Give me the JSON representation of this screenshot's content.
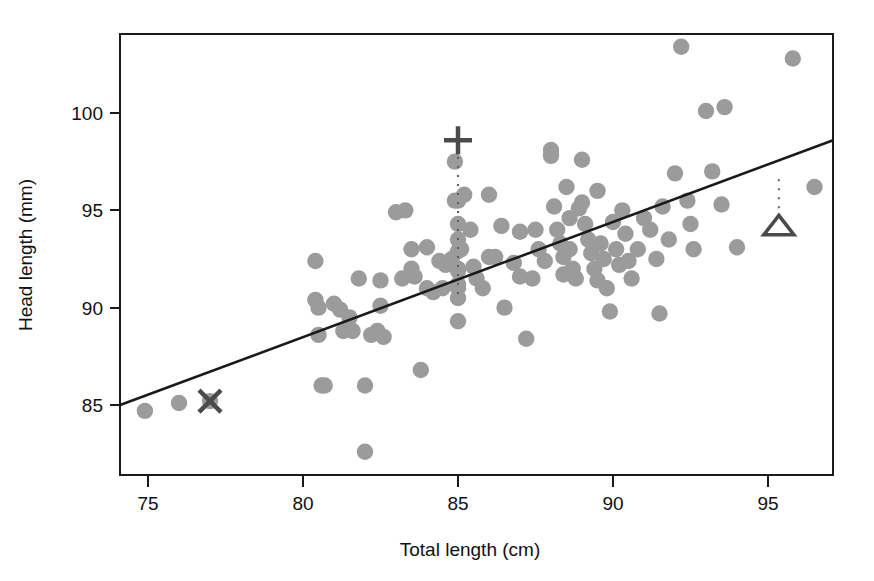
{
  "figure": {
    "background_color": "#ffffff",
    "frame_color": "#1a1a1a",
    "dot_color": "#9b9b9b",
    "marker_color": "#4a4a4a"
  },
  "chart_data": {
    "type": "scatter",
    "title": "",
    "xlabel": "Total length (cm)",
    "ylabel": "Head length (mm)",
    "xlim": [
      74.1,
      97.1
    ],
    "ylim": [
      82.0,
      104.2
    ],
    "xticks": [
      75,
      80,
      85,
      90,
      95
    ],
    "xticklabels": [
      "75",
      "80",
      "85",
      "90",
      "95"
    ],
    "yticks": [
      85,
      90,
      95,
      100
    ],
    "yticklabels": [
      "85",
      "90",
      "95",
      "100"
    ],
    "grid": false,
    "legend": null,
    "series": [
      {
        "name": "observations",
        "marker": "filled-circle",
        "color": "#9b9b9b",
        "x": [
          74.9,
          76.0,
          77.0,
          80.4,
          80.4,
          80.5,
          80.5,
          80.6,
          80.7,
          81.0,
          81.2,
          81.3,
          81.5,
          81.6,
          81.8,
          82.0,
          82.0,
          82.2,
          82.4,
          82.5,
          82.5,
          82.6,
          83.0,
          83.2,
          83.3,
          83.5,
          83.5,
          83.6,
          83.8,
          84.0,
          84.0,
          84.2,
          84.4,
          84.5,
          84.6,
          84.8,
          84.9,
          84.9,
          85.0,
          85.0,
          85.0,
          85.0,
          85.0,
          85.0,
          85.0,
          85.0,
          85.1,
          85.2,
          85.4,
          85.5,
          85.6,
          85.8,
          86.0,
          86.2,
          86.5,
          86.8,
          87.0,
          87.2,
          87.4,
          87.5,
          87.6,
          87.8,
          88.0,
          88.0,
          88.1,
          88.2,
          88.3,
          88.4,
          88.4,
          88.5,
          88.6,
          88.6,
          88.7,
          88.8,
          88.9,
          89.0,
          89.0,
          89.1,
          89.2,
          89.3,
          89.4,
          89.5,
          89.5,
          89.6,
          89.7,
          89.8,
          89.9,
          90.0,
          90.1,
          90.2,
          90.3,
          90.4,
          90.5,
          90.6,
          90.8,
          91.0,
          91.2,
          91.4,
          91.5,
          91.6,
          91.8,
          92.0,
          92.2,
          92.4,
          92.5,
          92.6,
          93.0,
          93.2,
          93.5,
          93.6,
          94.0,
          95.8,
          96.5,
          85.0,
          85.0,
          86.0,
          86.4,
          87.0
        ],
        "y": [
          84.7,
          85.1,
          85.2,
          92.4,
          90.4,
          90.0,
          88.6,
          86.0,
          86.0,
          90.2,
          89.9,
          88.8,
          89.5,
          88.8,
          91.5,
          86.0,
          82.6,
          88.6,
          88.8,
          91.4,
          90.1,
          88.5,
          94.9,
          91.5,
          95.0,
          93.0,
          92.0,
          91.6,
          86.8,
          93.1,
          91.0,
          90.8,
          92.4,
          91.0,
          92.2,
          92.5,
          97.5,
          95.5,
          95.5,
          94.3,
          93.5,
          92.9,
          92.0,
          91.2,
          90.5,
          89.3,
          93.0,
          95.8,
          94.0,
          92.1,
          91.5,
          91.0,
          95.8,
          92.6,
          90.0,
          92.3,
          93.9,
          88.4,
          91.5,
          94.0,
          93.0,
          92.4,
          98.1,
          97.8,
          95.2,
          94.0,
          93.3,
          92.6,
          91.7,
          96.2,
          94.6,
          93.0,
          92.0,
          91.5,
          95.1,
          97.6,
          95.4,
          94.3,
          93.5,
          92.8,
          92.0,
          96.0,
          91.4,
          93.3,
          92.5,
          91.0,
          89.8,
          94.4,
          93.0,
          92.2,
          95.0,
          93.8,
          92.4,
          91.5,
          93.0,
          94.6,
          94.0,
          92.5,
          89.7,
          95.2,
          93.5,
          96.9,
          103.4,
          95.5,
          94.3,
          93.0,
          100.1,
          97.0,
          95.3,
          100.3,
          93.1,
          102.8,
          96.2,
          91.9,
          91.0,
          92.6,
          94.2,
          91.6
        ]
      }
    ],
    "fit_line": {
      "name": "regression-line",
      "type": "line",
      "color": "#1a1a1a",
      "x_start": 74.1,
      "y_start": 85.0,
      "x_end": 97.1,
      "y_end": 98.6
    },
    "annotations": [
      {
        "name": "x-marker",
        "symbol": "cross-x",
        "x": 77.0,
        "y": 85.2,
        "leader": null
      },
      {
        "name": "plus-marker",
        "symbol": "plus",
        "x": 85.0,
        "y": 98.6,
        "leader": {
          "x": 85.0,
          "y_from": 98.2,
          "y_to": 90.6
        }
      },
      {
        "name": "triangle-marker",
        "symbol": "triangle-up",
        "x": 95.35,
        "y": 94.2,
        "leader": {
          "x": 95.35,
          "y_from": 96.6,
          "y_to": 94.6
        }
      }
    ]
  }
}
